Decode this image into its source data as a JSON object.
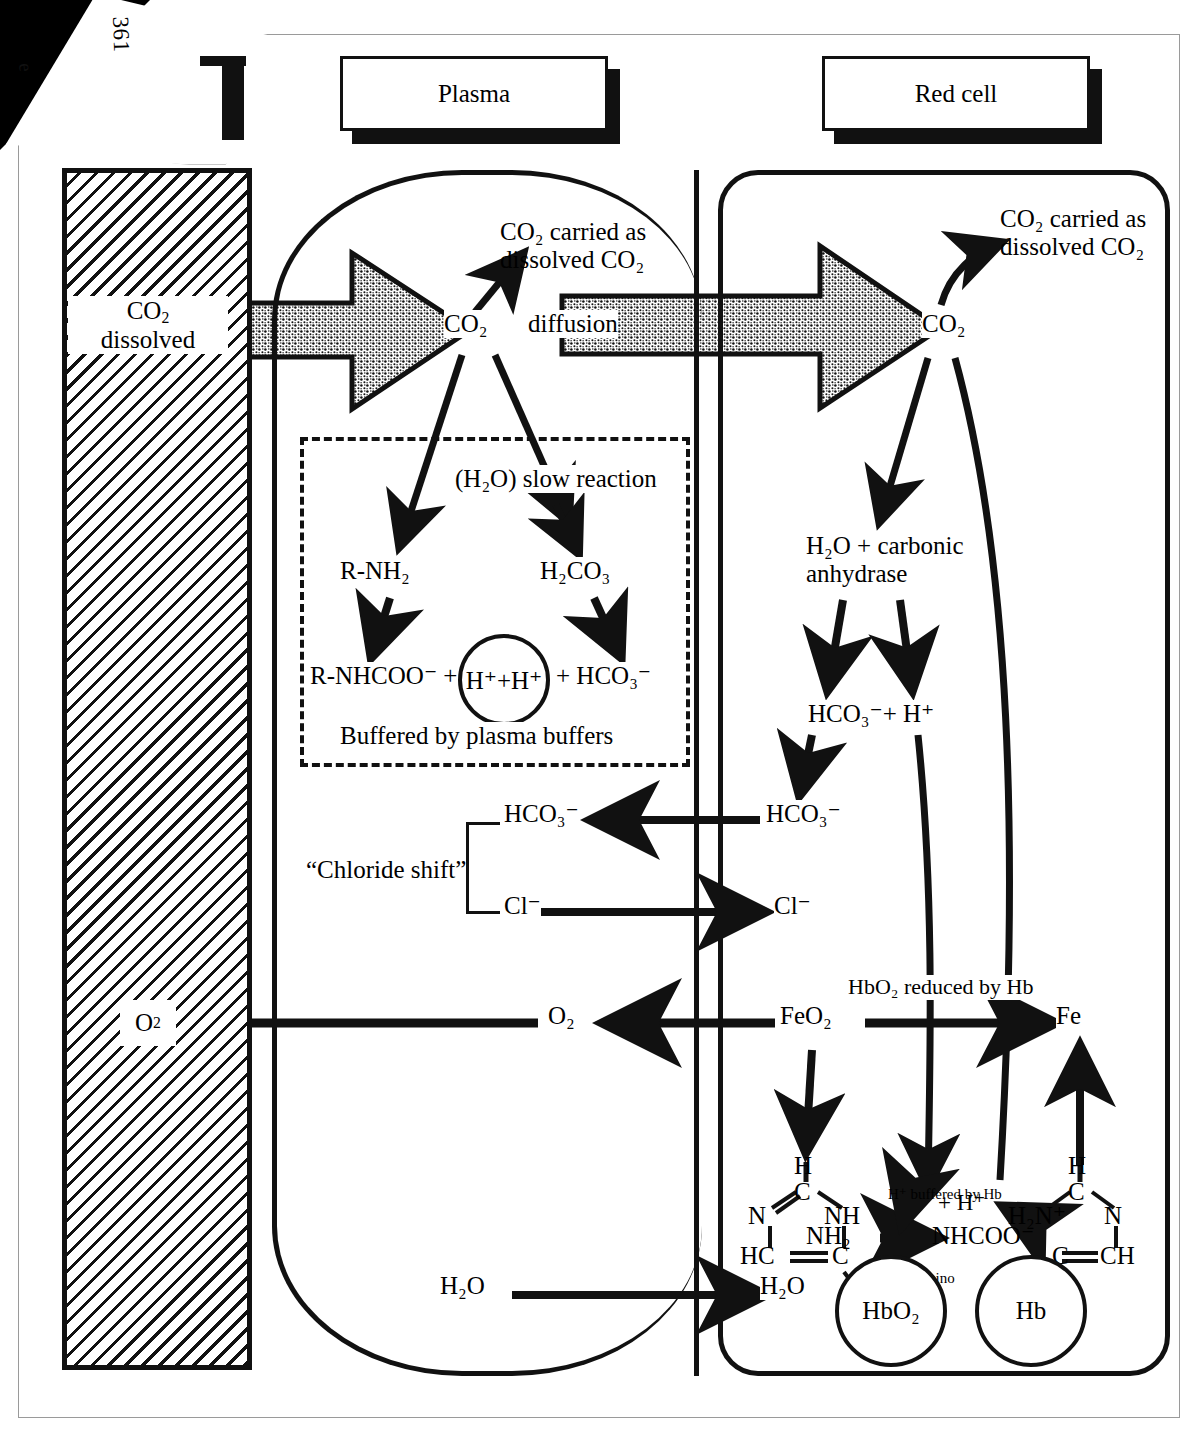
{
  "page": {
    "number": "361",
    "corner_glyph": "e"
  },
  "headers": {
    "plasma": "Plasma",
    "red_cell": "Red cell"
  },
  "tissue": {
    "co2_label_line1": "CO",
    "co2_label_sub": "2",
    "co2_label_line2": "dissolved",
    "o2_label": "O",
    "o2_sub": "2"
  },
  "plasma": {
    "co2_node": "CO₂",
    "co2_carried_line1": "CO₂ carried as",
    "co2_carried_line2": "dissolved CO₂",
    "diffusion": "diffusion",
    "slow_reaction": "(H₂O) slow reaction",
    "r_nh2": "R-NH₂",
    "h2co3": "H₂CO₃",
    "r_nhcoo": "R-NHCOO⁻ +",
    "h_circle": "H⁺+H⁺",
    "plus_hco3": "+ HCO₃⁻",
    "buffered": "Buffered by plasma buffers",
    "hco3": "HCO₃⁻",
    "cl": "Cl⁻",
    "chloride_shift": "“Chloride shift”",
    "o2": "O₂",
    "h2o": "H₂O"
  },
  "red_cell": {
    "co2_node": "CO₂",
    "co2_carried_line1": "CO₂ carried as",
    "co2_carried_line2": "dissolved CO₂",
    "carbonic_line1": "H₂O + carbonic",
    "carbonic_line2": "anhydrase",
    "hco3_plus_h": "HCO₃⁻+ H⁺",
    "hco3": "HCO₃⁻",
    "cl": "Cl⁻",
    "feo2": "FeO₂",
    "fe": "Fe",
    "hbo2_reduced": "HbO₂ reduced by Hb",
    "h2o": "H₂O",
    "hbo2_circle": "HbO₂",
    "hb_circle": "Hb",
    "h_buffered": "H⁺ buffered by Hb",
    "plus_h": "+ H⁺",
    "carbamino_line1": "Carbamino",
    "carbamino_line2": "formed",
    "nh2": "NH₂",
    "nhcoo": "NHCOO⁻"
  },
  "imidazole_left": {
    "h": "H",
    "c_top": "C",
    "n_left": "N",
    "nh_right": "NH",
    "hc": "HC",
    "c_bottom": "C"
  },
  "imidazole_right": {
    "h": "H",
    "c_top": "C",
    "h2n": "H₂N⁺",
    "n_right": "N",
    "c_left": "C",
    "ch": "CH"
  },
  "colors": {
    "ink": "#111111",
    "paper": "#ffffff",
    "frame": "#9a9a9a"
  }
}
